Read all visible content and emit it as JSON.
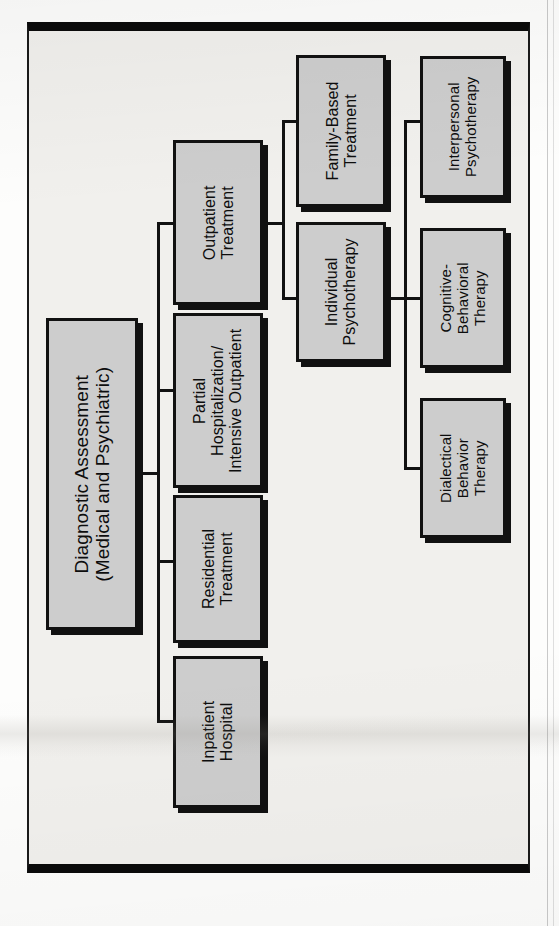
{
  "page": {
    "background_color": "#f1f0ed",
    "frame_color": "#0a0a0a",
    "node_fill_color": "#cdcdcd",
    "node_border_color": "#111111",
    "orientation": "rotated-90-clockwise"
  },
  "diagram": {
    "type": "treatment-level-of-care-flowchart",
    "root": {
      "id": "diagnostic-assessment",
      "label": "Diagnostic Assessment\n(Medical and Psychiatric)",
      "line1": "Diagnostic Assessment",
      "line2": "(Medical and Psychiatric)"
    },
    "level2": [
      {
        "id": "inpatient-hospital",
        "line1": "Inpatient",
        "line2": "Hospital",
        "line3": ""
      },
      {
        "id": "residential-treatment",
        "line1": "Residential",
        "line2": "Treatment",
        "line3": ""
      },
      {
        "id": "partial-hospitalization",
        "line1": "Partial",
        "line2": "Hospitalization/",
        "line3": "Intensive Outpatient"
      },
      {
        "id": "outpatient-treatment",
        "line1": "Outpatient",
        "line2": "Treatment",
        "line3": ""
      }
    ],
    "level3": [
      {
        "id": "individual-psychotherapy",
        "line1": "Individual",
        "line2": "Psychotherapy",
        "line3": ""
      },
      {
        "id": "family-based-treatment",
        "line1": "Family-Based",
        "line2": "Treatment",
        "line3": ""
      }
    ],
    "level4": [
      {
        "id": "dialectical-behavior-therapy",
        "line1": "Dialectical",
        "line2": "Behavior",
        "line3": "Therapy"
      },
      {
        "id": "cognitive-behavioral-therapy",
        "line1": "Cognitive-",
        "line2": "Behavioral",
        "line3": "Therapy"
      },
      {
        "id": "interpersonal-psychotherapy",
        "line1": "Interpersonal",
        "line2": "Psychotherapy",
        "line3": ""
      }
    ]
  }
}
